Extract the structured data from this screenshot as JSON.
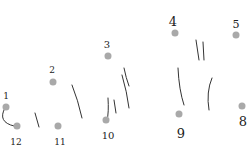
{
  "puzzle": {
    "type": "connect-the-dots",
    "dot_color": "#a9a9a9",
    "stroke_color": "#333333",
    "points": [
      {
        "n": "1",
        "dot": [
          6,
          107
        ],
        "label": [
          6,
          96
        ],
        "size": 9
      },
      {
        "n": "2",
        "dot": [
          53,
          82
        ],
        "label": [
          52,
          70
        ],
        "size": 9
      },
      {
        "n": "3",
        "dot": [
          108,
          56
        ],
        "label": [
          107,
          45
        ],
        "size": 10
      },
      {
        "n": "4",
        "dot": [
          175,
          33
        ],
        "label": [
          173,
          21
        ],
        "size": 13
      },
      {
        "n": "5",
        "dot": [
          236,
          35
        ],
        "label": [
          236,
          24
        ],
        "size": 11
      },
      {
        "n": "8",
        "dot": [
          242,
          106
        ],
        "label": [
          243,
          121
        ],
        "size": 13
      },
      {
        "n": "9",
        "dot": [
          179,
          114
        ],
        "label": [
          181,
          133
        ],
        "size": 13
      },
      {
        "n": "10",
        "dot": [
          106,
          120
        ],
        "label": [
          108,
          136
        ],
        "size": 10
      },
      {
        "n": "11",
        "dot": [
          58,
          126
        ],
        "label": [
          60,
          142
        ],
        "size": 9
      },
      {
        "n": "12",
        "dot": [
          17,
          126
        ],
        "label": [
          16,
          142
        ],
        "size": 9
      }
    ],
    "strokes": [
      "M5 108 Q-3 122 14 126",
      "M35 113 L39 127",
      "M72 85 Q78 100 82 118",
      "M108 98 Q109 112 107 121",
      "M114 100 L116 113",
      "M124 68 Q126 78 129 86",
      "M122 75 Q127 92 129 108",
      "M196 40 L199 60",
      "M203 42 L204 60",
      "M178 68 Q179 90 184 105",
      "M212 78 Q206 92 209 110"
    ]
  }
}
